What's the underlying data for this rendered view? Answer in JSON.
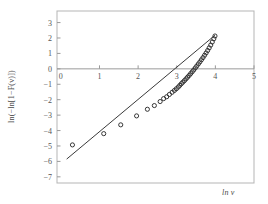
{
  "figure": {
    "background": "#ffffff",
    "frame_color": "#b5b5b5",
    "axis_color": "#9a9a9a",
    "tick_label_color": "#555555",
    "marker_color": "#222222",
    "line_color": "#3a3a3a"
  },
  "axes": {
    "xlabel": "ln v",
    "ylabel": "ln(−ln[1−F(v)])",
    "x_ticks": [
      0,
      1,
      2,
      3,
      4,
      5
    ],
    "x_tick_labels": [
      "0",
      "1",
      "2",
      "3",
      "4",
      "5"
    ],
    "y_ticks": [
      3,
      2,
      1,
      0,
      -1,
      -2,
      -3,
      -4,
      -5,
      -6,
      -7
    ],
    "y_tick_labels": [
      "3",
      "2",
      "1",
      "0",
      "−1",
      "−2",
      "−3",
      "−4",
      "−5",
      "−6",
      "−7"
    ],
    "xlim": [
      -0.1,
      5.0
    ],
    "ylim": [
      -7.4,
      3.75
    ],
    "grid": false
  },
  "chart_data": {
    "type": "scatter",
    "title": "",
    "subtitle": "",
    "xlabel": "ln v",
    "ylabel": "ln(−ln[1−F(v)])",
    "xlim": [
      -0.1,
      5.0
    ],
    "ylim": [
      -7.4,
      3.75
    ],
    "grid": false,
    "legend": null,
    "legend_position": "none",
    "annotations": [],
    "series": [
      {
        "name": "Observed data (Weibull plotting positions)",
        "type": "scatter",
        "marker": "open-circle",
        "marker_size": 3,
        "color": "#222222",
        "points": [
          [
            0.3,
            -4.93
          ],
          [
            1.11,
            -4.2
          ],
          [
            1.55,
            -3.63
          ],
          [
            1.96,
            -3.05
          ],
          [
            2.24,
            -2.62
          ],
          [
            2.42,
            -2.38
          ],
          [
            2.57,
            -2.12
          ],
          [
            2.66,
            -1.93
          ],
          [
            2.74,
            -1.81
          ],
          [
            2.81,
            -1.66
          ],
          [
            2.88,
            -1.52
          ],
          [
            2.94,
            -1.4
          ],
          [
            2.99,
            -1.29
          ],
          [
            3.04,
            -1.18
          ],
          [
            3.08,
            -1.07
          ],
          [
            3.12,
            -0.96
          ],
          [
            3.16,
            -0.86
          ],
          [
            3.2,
            -0.76
          ],
          [
            3.24,
            -0.65
          ],
          [
            3.28,
            -0.54
          ],
          [
            3.32,
            -0.43
          ],
          [
            3.36,
            -0.31
          ],
          [
            3.4,
            -0.19
          ],
          [
            3.44,
            -0.07
          ],
          [
            3.48,
            0.06
          ],
          [
            3.52,
            0.19
          ],
          [
            3.56,
            0.32
          ],
          [
            3.6,
            0.45
          ],
          [
            3.64,
            0.59
          ],
          [
            3.68,
            0.73
          ],
          [
            3.72,
            0.88
          ],
          [
            3.76,
            1.03
          ],
          [
            3.8,
            1.19
          ],
          [
            3.84,
            1.36
          ],
          [
            3.88,
            1.54
          ],
          [
            3.92,
            1.74
          ],
          [
            3.96,
            1.95
          ],
          [
            3.99,
            2.13
          ]
        ]
      },
      {
        "name": "Fitted straight line",
        "type": "line",
        "color": "#3a3a3a",
        "endpoints": [
          [
            0.15,
            -5.85
          ],
          [
            3.99,
            2.18
          ]
        ],
        "slope": 2.09,
        "intercept": -6.16
      }
    ]
  }
}
